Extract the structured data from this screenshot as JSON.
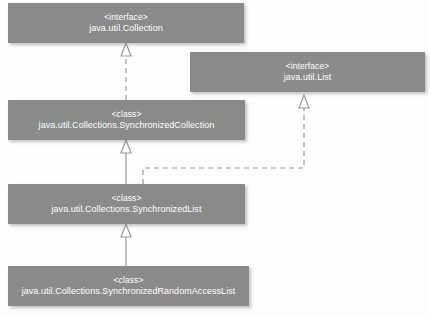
{
  "diagram": {
    "type": "uml-class-diagram",
    "canvas": {
      "width": 430,
      "height": 316,
      "background": "#fdfdfd"
    },
    "style": {
      "box_fill": "#8a8a8a",
      "box_text": "#ffffff",
      "edge_color": "#9a9a9a",
      "arrow_fill": "#fdfdfd"
    },
    "nodes": [
      {
        "id": "collection",
        "stereotype": "<interface>",
        "name": "java.util.Collection",
        "x": 8,
        "y": 3,
        "width": 236,
        "height": 40
      },
      {
        "id": "list",
        "stereotype": "<interface>",
        "name": "java.util.List",
        "x": 190,
        "y": 52,
        "width": 235,
        "height": 40
      },
      {
        "id": "synchronized-collection",
        "stereotype": "<class>",
        "name": "java.util.Collections.SynchronizedCollection",
        "x": 8,
        "y": 100,
        "width": 237,
        "height": 40
      },
      {
        "id": "synchronized-list",
        "stereotype": "<class>",
        "name": "java.util.Collections.SynchronizedList",
        "x": 8,
        "y": 184,
        "width": 237,
        "height": 40
      },
      {
        "id": "synchronized-random-access-list",
        "stereotype": "<class>",
        "name": "java.util.Collections.SynchronizedRandomAccessList",
        "x": 8,
        "y": 266,
        "width": 241,
        "height": 40
      }
    ],
    "edges": [
      {
        "id": "edge-synccollection-implements-collection",
        "from": "synchronized-collection",
        "to": "collection",
        "relation": "realization",
        "line": "dashed",
        "arrow": "hollow-triangle"
      },
      {
        "id": "edge-synclist-extends-synccollection",
        "from": "synchronized-list",
        "to": "synchronized-collection",
        "relation": "generalization",
        "line": "solid",
        "arrow": "hollow-triangle"
      },
      {
        "id": "edge-syncrandomaccesslist-extends-synclist",
        "from": "synchronized-random-access-list",
        "to": "synchronized-list",
        "relation": "generalization",
        "line": "solid",
        "arrow": "hollow-triangle"
      },
      {
        "id": "edge-synclist-implements-list",
        "from": "synchronized-list",
        "to": "list",
        "relation": "realization",
        "line": "dashed",
        "arrow": "hollow-triangle"
      }
    ]
  }
}
